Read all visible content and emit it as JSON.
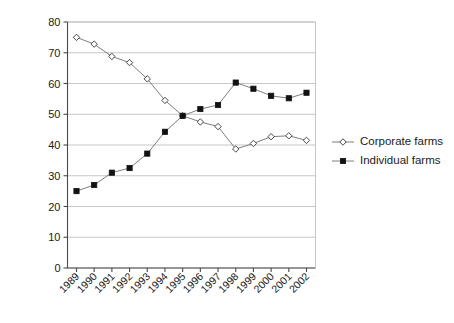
{
  "chart_data": {
    "type": "line",
    "title": "",
    "xlabel": "",
    "ylabel": "Share of agric output (%)",
    "ylim": [
      0,
      80
    ],
    "yticks": [
      0,
      10,
      20,
      30,
      40,
      50,
      60,
      70,
      80
    ],
    "ytick_labels": [
      "0",
      "10",
      "20",
      "30",
      "40",
      "50",
      "60",
      "70",
      "80"
    ],
    "grid": true,
    "legend_position": "right",
    "categories": [
      "1989",
      "1990",
      "1991",
      "1992",
      "1993",
      "1994",
      "1995",
      "1996",
      "1997",
      "1998",
      "1999",
      "2000",
      "2001",
      "2002"
    ],
    "series": [
      {
        "name": "Corporate farms",
        "marker": "open-diamond",
        "color": "#6f6f6f",
        "values": [
          75.0,
          72.8,
          68.8,
          66.8,
          61.5,
          54.5,
          49.5,
          47.5,
          46.0,
          38.7,
          40.5,
          42.7,
          43.0,
          41.5
        ]
      },
      {
        "name": "Individual farms",
        "marker": "filled-square",
        "color": "#111111",
        "values": [
          25.0,
          27.0,
          31.0,
          32.5,
          37.2,
          44.3,
          49.5,
          51.7,
          53.0,
          60.3,
          58.3,
          56.0,
          55.2,
          57.0
        ]
      }
    ]
  },
  "legend": {
    "items": [
      {
        "label": "Corporate farms",
        "marker": "open-diamond"
      },
      {
        "label": "Individual farms",
        "marker": "filled-square"
      }
    ]
  }
}
